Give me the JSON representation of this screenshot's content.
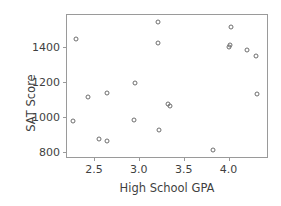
{
  "chart_data": {
    "type": "scatter",
    "title": "",
    "xlabel": "High School GPA",
    "ylabel": "SAT Score",
    "xlim": [
      2.2,
      4.45
    ],
    "ylim": [
      760,
      1580
    ],
    "xticks": [
      2.5,
      3.0,
      3.5,
      4.0
    ],
    "xtick_labels": [
      "2.5",
      "3.0",
      "3.5",
      "4.0"
    ],
    "yticks": [
      800,
      1000,
      1200,
      1400
    ],
    "ytick_labels": [
      "800",
      "1000",
      "1200",
      "1400"
    ],
    "grid": false,
    "legend": null,
    "marker": "open-circle",
    "marker_color": "#6e6e6e",
    "points": [
      {
        "x": 2.3,
        "y": 1445
      },
      {
        "x": 2.27,
        "y": 975
      },
      {
        "x": 2.43,
        "y": 1115
      },
      {
        "x": 2.56,
        "y": 875
      },
      {
        "x": 2.65,
        "y": 865
      },
      {
        "x": 2.65,
        "y": 1135
      },
      {
        "x": 2.96,
        "y": 1190
      },
      {
        "x": 2.95,
        "y": 980
      },
      {
        "x": 3.21,
        "y": 1540
      },
      {
        "x": 3.21,
        "y": 1418
      },
      {
        "x": 3.23,
        "y": 925
      },
      {
        "x": 3.33,
        "y": 1075
      },
      {
        "x": 3.35,
        "y": 1062
      },
      {
        "x": 3.83,
        "y": 810
      },
      {
        "x": 4.03,
        "y": 1512
      },
      {
        "x": 4.0,
        "y": 1395
      },
      {
        "x": 4.02,
        "y": 1412
      },
      {
        "x": 4.2,
        "y": 1378
      },
      {
        "x": 4.3,
        "y": 1348
      },
      {
        "x": 4.32,
        "y": 1128
      }
    ]
  }
}
